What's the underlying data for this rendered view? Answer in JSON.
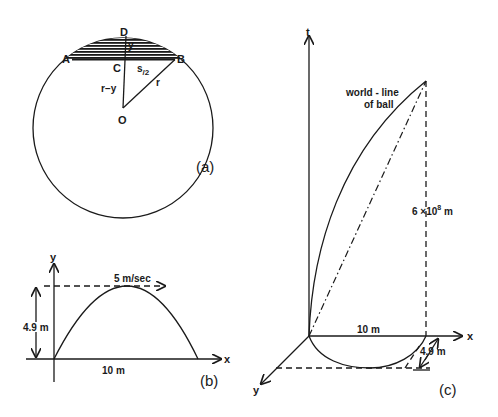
{
  "panel_a": {
    "caption": "(a)",
    "points": {
      "A": "A",
      "B": "B",
      "C": "C",
      "D": "D",
      "O": "O"
    },
    "labels": {
      "y": "y",
      "s_half": "s/2",
      "s_half_main": "s",
      "s_half_sub": "2",
      "r_minus_y": "r−y",
      "r": "r"
    }
  },
  "panel_b": {
    "caption": "(b)",
    "axis_y": "y",
    "axis_x": "x",
    "height_label": "4.9 m",
    "velocity_label": "5 m/sec",
    "range_label": "10 m"
  },
  "panel_c": {
    "caption": "(c)",
    "axis_t": "t",
    "axis_x": "x",
    "axis_y": "y",
    "worldline_label_line1": "world - line",
    "worldline_label_line2": "of ball",
    "time_label_base": "6 ×10",
    "time_label_exp": "8",
    "time_label_unit": " m",
    "range_label": "10 m",
    "height_label": "4.9 m"
  }
}
